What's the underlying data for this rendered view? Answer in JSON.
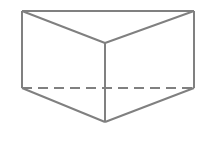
{
  "figure": {
    "name": "triangular-prism",
    "canvas": {
      "width": 205,
      "height": 145,
      "background_color": "#ffffff"
    },
    "style": {
      "stroke_color": "#808080",
      "stroke_width": 2,
      "fill_color": "none",
      "dash_pattern": "10 6",
      "line_cap": "butt",
      "line_join": "miter"
    },
    "vertices": {
      "top_left": {
        "label": "A",
        "x": 22,
        "y": 11
      },
      "top_right": {
        "label": "B",
        "x": 194,
        "y": 11
      },
      "front_top_apex": {
        "label": "C",
        "x": 105,
        "y": 43
      },
      "back_left": {
        "label": "D",
        "x": 22,
        "y": 88
      },
      "back_right": {
        "label": "E",
        "x": 194,
        "y": 88
      },
      "front_bottom_apex": {
        "label": "F",
        "x": 105,
        "y": 122
      }
    },
    "edges": [
      {
        "name": "top-edge",
        "from": "top_left",
        "to": "top_right",
        "hidden": false,
        "style": "solid"
      },
      {
        "name": "left-vertical-edge",
        "from": "top_left",
        "to": "back_left",
        "hidden": false,
        "style": "solid"
      },
      {
        "name": "right-vertical-edge",
        "from": "top_right",
        "to": "back_right",
        "hidden": false,
        "style": "solid"
      },
      {
        "name": "upper-left-diagonal",
        "from": "top_left",
        "to": "front_top_apex",
        "hidden": false,
        "style": "solid"
      },
      {
        "name": "upper-right-diagonal",
        "from": "top_right",
        "to": "front_top_apex",
        "hidden": false,
        "style": "solid"
      },
      {
        "name": "center-vertical-edge",
        "from": "front_top_apex",
        "to": "front_bottom_apex",
        "hidden": false,
        "style": "solid"
      },
      {
        "name": "lower-left-diagonal",
        "from": "back_left",
        "to": "front_bottom_apex",
        "hidden": false,
        "style": "solid"
      },
      {
        "name": "lower-right-diagonal",
        "from": "back_right",
        "to": "front_bottom_apex",
        "hidden": false,
        "style": "solid"
      },
      {
        "name": "hidden-back-bottom-edge",
        "from": "back_left",
        "to": "back_right",
        "hidden": true,
        "style": "dashed"
      }
    ],
    "paths": {
      "top_edge": "M 22 11 L 194 11",
      "left_vertical_edge": "M 22 11 L 22 88",
      "right_vertical_edge": "M 194 11 L 194 88",
      "upper_left_diagonal": "M 22 11 L 105 43",
      "upper_right_diagonal": "M 194 11 L 105 43",
      "center_vertical_edge": "M 105 43 L 105 122",
      "lower_left_diagonal": "M 22 88 L 105 122",
      "lower_right_diagonal": "M 194 88 L 105 122",
      "hidden_back_bottom_edge": "M 22 88 L 194 88"
    }
  }
}
